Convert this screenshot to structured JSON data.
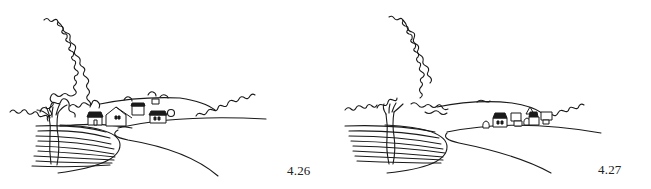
{
  "figures": [
    {
      "id": "fig-4-26",
      "caption": "4.26",
      "scene": "landscape with road curving into foreground, tree on left, cluster of houses in middle distance near road"
    },
    {
      "id": "fig-4-27",
      "caption": "4.27",
      "scene": "landscape with road curving into foreground, tree on left, small village of houses further back on the right horizon"
    }
  ],
  "colors": {
    "ink": "#1a1a1a",
    "paper": "#ffffff"
  }
}
